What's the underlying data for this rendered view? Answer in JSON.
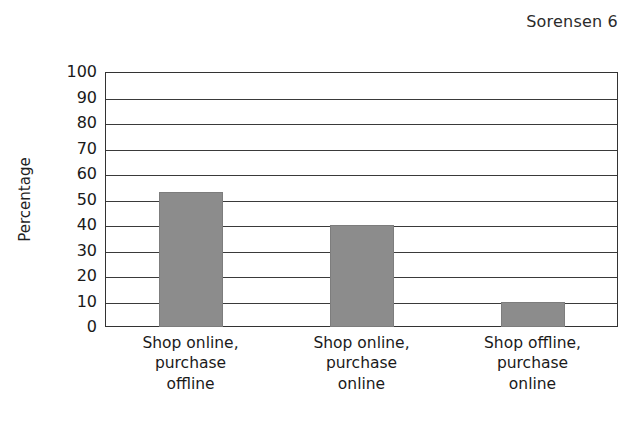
{
  "header": {
    "running_head": "Sorensen 6"
  },
  "chart_data": {
    "type": "bar",
    "title": "",
    "xlabel": "",
    "ylabel": "Percentage",
    "categories": [
      "Shop online, purchase offline",
      "Shop online, purchase online",
      "Shop offline, purchase online"
    ],
    "category_lines": [
      [
        "Shop online,",
        "purchase",
        "offline"
      ],
      [
        "Shop online,",
        "purchase",
        "online"
      ],
      [
        "Shop offline,",
        "purchase",
        "online"
      ]
    ],
    "values": [
      53,
      40,
      10
    ],
    "ylim": [
      0,
      100
    ],
    "ytick_step": 10,
    "yticks": [
      100,
      90,
      80,
      70,
      60,
      50,
      40,
      30,
      20,
      10,
      0
    ],
    "grid": true,
    "legend": "none",
    "bar_color": "#8c8c8c",
    "frame_color": "#333333",
    "background": "#ffffff"
  }
}
